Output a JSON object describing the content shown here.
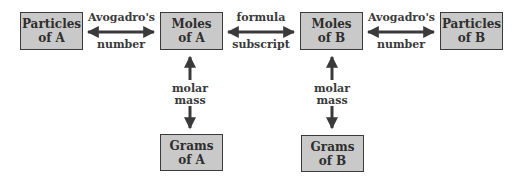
{
  "boxes": {
    "particles_a": "Particles\nof A",
    "moles_a": "Moles\nof A",
    "moles_b": "Moles\nof B",
    "particles_b": "Particles\nof B",
    "grams_a": "Grams\nof A",
    "grams_b": "Grams\nof B"
  },
  "labels": {
    "avogadro_left_top": "Avogadro's",
    "avogadro_left_bottom": "number",
    "formula_top": "formula",
    "formula_bottom": "subscript",
    "avogadro_right_top": "Avogadro's",
    "avogadro_right_bottom": "number",
    "molar_a_top": "molar",
    "molar_a_bottom": "mass",
    "molar_b_top": "molar",
    "molar_b_bottom": "mass"
  },
  "colors": {
    "box_fill": "#c9c9c9",
    "stroke": "#3a3a3a"
  }
}
